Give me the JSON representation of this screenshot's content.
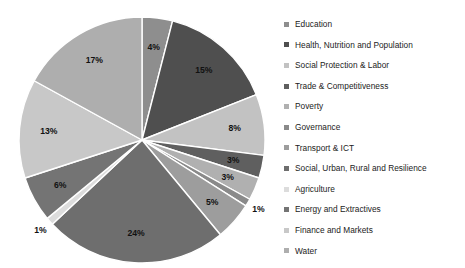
{
  "chart_data": {
    "type": "pie",
    "title": "",
    "labels": [
      "Education",
      "Health, Nutrition and Population",
      "Social Protection & Labor",
      "Trade & Competitiveness",
      "Poverty",
      "Governance",
      "Transport & ICT",
      "Social, Urban, Rural and Resilience",
      "Agriculture",
      "Energy and Extractives",
      "Finance and Markets",
      "Water"
    ],
    "values": [
      4,
      15,
      8,
      3,
      3,
      1,
      5,
      24,
      1,
      6,
      13,
      17
    ],
    "value_labels": [
      "4%",
      "15%",
      "8%",
      "3%",
      "3%",
      "1%",
      "5%",
      "24%",
      "1%",
      "6%",
      "13%",
      "17%"
    ],
    "colors": [
      "#8e8e8e",
      "#4f4f4f",
      "#c2c2c2",
      "#5f5f5f",
      "#b0b0b0",
      "#8a8a8a",
      "#9d9d9d",
      "#6e6e6e",
      "#dcdcdc",
      "#747474",
      "#c8c8c8",
      "#aeaeae"
    ],
    "start_angle": 0,
    "direction": "clockwise",
    "legend_position": "right",
    "grid": false,
    "units": "percent",
    "total": 100
  },
  "legend": {
    "items": [
      {
        "label": "Education",
        "color": "#8e8e8e"
      },
      {
        "label": "Health, Nutrition and Population",
        "color": "#4f4f4f"
      },
      {
        "label": "Social Protection & Labor",
        "color": "#c2c2c2"
      },
      {
        "label": "Trade & Competitiveness",
        "color": "#5f5f5f"
      },
      {
        "label": "Poverty",
        "color": "#b0b0b0"
      },
      {
        "label": "Governance",
        "color": "#8a8a8a"
      },
      {
        "label": "Transport & ICT",
        "color": "#9d9d9d"
      },
      {
        "label": "Social, Urban, Rural and Resilience",
        "color": "#6e6e6e"
      },
      {
        "label": "Agriculture",
        "color": "#dcdcdc"
      },
      {
        "label": "Energy and Extractives",
        "color": "#747474"
      },
      {
        "label": "Finance and Markets",
        "color": "#c8c8c8"
      },
      {
        "label": "Water",
        "color": "#aeaeae"
      }
    ]
  },
  "geometry": {
    "cx": 142,
    "cy": 140,
    "r": 123,
    "label_radius_factor": 0.76,
    "separator_color": "#ffffff",
    "separator_width": 1.4
  }
}
